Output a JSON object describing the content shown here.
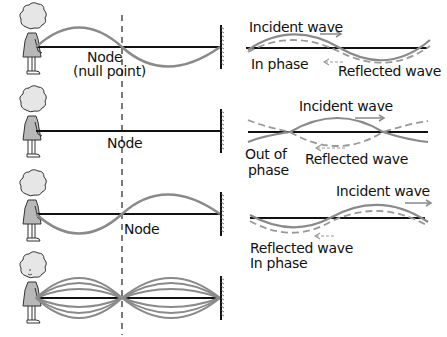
{
  "colors": {
    "string": "#111111",
    "wave": "#8a8a8a",
    "reflected": "#999999",
    "figure_fill": "#b8b8b8",
    "background": "#ffffff"
  },
  "left_panels": [
    {
      "id": "panel-1",
      "node_label": "Node",
      "node_sublabel": "(null point)",
      "wave_shape": "one-full-wavelength"
    },
    {
      "id": "panel-2",
      "node_label": "Node",
      "wave_shape": "flat"
    },
    {
      "id": "panel-3",
      "node_label": "Node",
      "wave_shape": "one-full-wavelength-inverted"
    },
    {
      "id": "panel-4",
      "wave_shape": "standing-wave-envelope"
    }
  ],
  "right_panels": [
    {
      "id": "phase-1",
      "incident_label": "Incident wave",
      "reflected_label": "Reflected wave",
      "phase_label": "In phase"
    },
    {
      "id": "phase-2",
      "incident_label": "Incident wave",
      "reflected_label": "Reflected wave",
      "phase_label": "Out of phase"
    },
    {
      "id": "phase-3",
      "incident_label": "Incident wave",
      "reflected_label": "Reflected wave",
      "phase_label": "In phase"
    }
  ],
  "labels": {
    "p1_node": "Node",
    "p1_null": "(null point)",
    "p2_node": "Node",
    "p3_node": "Node",
    "r1_incident": "Incident wave",
    "r1_inphase": "In phase",
    "r1_reflected": "Reflected wave",
    "r2_incident": "Incident wave",
    "r2_out": "Out of",
    "r2_phase": "phase",
    "r2_reflected": "Reflected wave",
    "r3_incident": "Incident wave",
    "r3_reflected": "Reflected wave",
    "r3_inphase": "In phase"
  }
}
